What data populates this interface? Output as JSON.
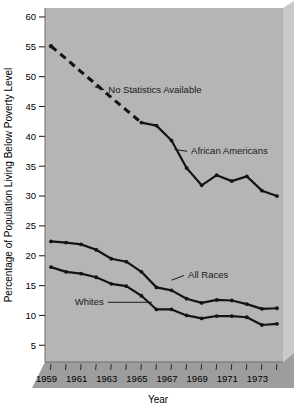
{
  "chart_data": {
    "type": "line",
    "title": "",
    "xlabel": "Year",
    "ylabel": "Percentage of Population Living Below Poverty Level",
    "xlim": [
      1958.6,
      1974.4
    ],
    "ylim": [
      2.2,
      61.5
    ],
    "yticks": [
      5,
      10,
      15,
      20,
      25,
      30,
      35,
      40,
      45,
      50,
      55,
      60
    ],
    "ytick_labels": [
      "5",
      "10",
      "15",
      "20",
      "25",
      "30",
      "35",
      "40",
      "45",
      "50",
      "55",
      "60"
    ],
    "xticks": [
      1959,
      1960,
      1961,
      1962,
      1963,
      1964,
      1965,
      1966,
      1967,
      1968,
      1969,
      1970,
      1971,
      1972,
      1973,
      1974
    ],
    "xtick_labels": [
      "1959",
      "",
      "1961",
      "",
      "1963",
      "",
      "1965",
      "",
      "1967",
      "",
      "1969",
      "",
      "1971",
      "",
      "1973",
      ""
    ],
    "grid": false,
    "legend": "none (inline annotated labels)",
    "plot_background": "#b5b5b5",
    "line_color": "#141414",
    "series": [
      {
        "name": "African Americans",
        "style": "dashed-then-solid",
        "x": [
          1959,
          1960,
          1961,
          1962,
          1963,
          1964,
          1965,
          1966,
          1967,
          1968,
          1969,
          1970,
          1971,
          1972,
          1973,
          1974
        ],
        "values": [
          55.1,
          53.0,
          50.8,
          48.7,
          46.5,
          44.4,
          42.3,
          41.8,
          39.3,
          34.7,
          31.8,
          33.5,
          32.5,
          33.3,
          30.9,
          30.0
        ],
        "dashed_through": 1965,
        "markers_visible_from": 1965
      },
      {
        "name": "All Races",
        "style": "solid",
        "x": [
          1959,
          1960,
          1961,
          1962,
          1963,
          1964,
          1965,
          1966,
          1967,
          1968,
          1969,
          1970,
          1971,
          1972,
          1973,
          1974
        ],
        "values": [
          22.4,
          22.2,
          21.9,
          21.0,
          19.5,
          19.0,
          17.3,
          14.7,
          14.2,
          12.8,
          12.1,
          12.6,
          12.5,
          11.9,
          11.1,
          11.2
        ]
      },
      {
        "name": "Whites",
        "style": "solid",
        "x": [
          1959,
          1960,
          1961,
          1962,
          1963,
          1964,
          1965,
          1966,
          1967,
          1968,
          1969,
          1970,
          1971,
          1972,
          1973,
          1974
        ],
        "values": [
          18.1,
          17.3,
          17.0,
          16.4,
          15.3,
          14.9,
          13.3,
          11.0,
          11.0,
          10.0,
          9.5,
          9.9,
          9.9,
          9.7,
          8.4,
          8.6
        ]
      }
    ],
    "annotations": [
      {
        "name": "no-statistics-available",
        "text": "No Statistics Available",
        "x": 1962.8,
        "y": 47.3,
        "leader_to_x": 1961.9,
        "leader_to_y": 48.3
      },
      {
        "name": "african-americans",
        "text": "African Americans",
        "x": 1968.3,
        "y": 37.0,
        "leader_to_x": 1967.2,
        "leader_to_y": 37.8
      },
      {
        "name": "all-races",
        "text": "All Races",
        "x": 1968.1,
        "y": 16.2,
        "leader_to_x": 1967.0,
        "leader_to_y": 15.9
      },
      {
        "name": "whites",
        "text": "Whites",
        "x": 1962.5,
        "y": 11.7,
        "leader_to_x": 1965.7,
        "leader_to_y": 12.2
      }
    ]
  }
}
